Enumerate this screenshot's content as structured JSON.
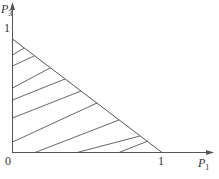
{
  "diagram": {
    "type": "simplex-region",
    "axes": {
      "x": {
        "label": "P",
        "subscript": "1",
        "tick": "1"
      },
      "y": {
        "label": "P",
        "subscript": "3",
        "tick": "1"
      },
      "origin": "0"
    },
    "region": {
      "description": "Hatched triangle P1 + P3 <= 1, P1>=0, P3>=0",
      "vertices": [
        [
          0,
          0
        ],
        [
          1,
          0
        ],
        [
          0,
          1
        ]
      ]
    },
    "colors": {
      "line": "#555555",
      "background": "#ffffff"
    }
  }
}
